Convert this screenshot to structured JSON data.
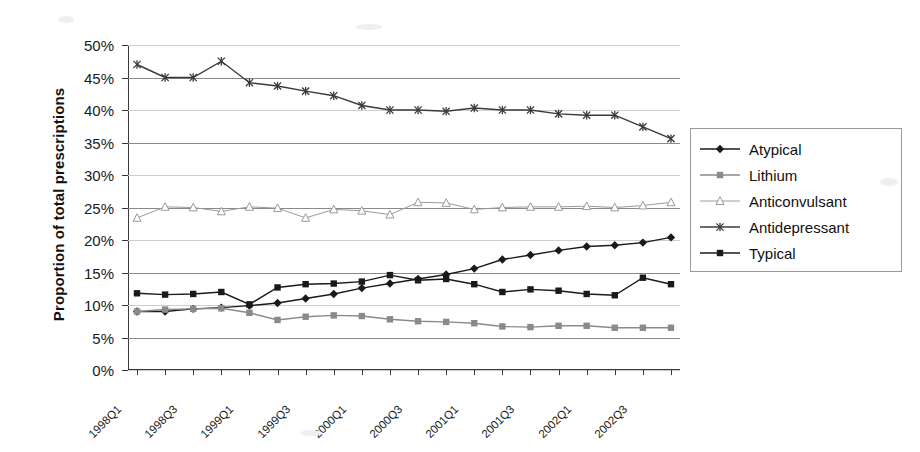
{
  "chart_data": {
    "type": "line",
    "title": "",
    "xlabel": "",
    "ylabel": "Proportion of total prescriptions",
    "ylim": [
      0,
      50
    ],
    "ytick_labels": [
      "0%",
      "5%",
      "10%",
      "15%",
      "20%",
      "25%",
      "30%",
      "35%",
      "40%",
      "45%",
      "50%"
    ],
    "ytick_values": [
      0,
      5,
      10,
      15,
      20,
      25,
      30,
      35,
      40,
      45,
      50
    ],
    "grid": true,
    "legend_position": "right",
    "x": [
      "1998Q1",
      "1998Q2",
      "1998Q3",
      "1998Q4",
      "1999Q1",
      "1999Q2",
      "1999Q3",
      "1999Q4",
      "2000Q1",
      "2000Q2",
      "2000Q3",
      "2000Q4",
      "2001Q1",
      "2001Q2",
      "2001Q3",
      "2001Q4",
      "2002Q1",
      "2002Q2",
      "2002Q3",
      "2002Q4"
    ],
    "xtick_labels": [
      "1998Q1",
      "1998Q3",
      "1999Q1",
      "1999Q3",
      "2000Q1",
      "2000Q3",
      "2001Q1",
      "2001Q3",
      "2002Q1",
      "2002Q3"
    ],
    "xtick_label_indices": [
      0,
      2,
      4,
      6,
      8,
      10,
      12,
      14,
      16,
      18
    ],
    "series": [
      {
        "name": "Atypical",
        "marker": "diamond",
        "color": "#1a1a1a",
        "values": [
          9.0,
          9.0,
          9.4,
          9.6,
          9.9,
          10.3,
          11.0,
          11.7,
          12.6,
          13.3,
          14.0,
          14.7,
          15.6,
          17.0,
          17.7,
          18.4,
          19.0,
          19.2,
          19.6,
          20.4
        ]
      },
      {
        "name": "Lithium",
        "marker": "square-gray",
        "color": "#8a8a8a",
        "values": [
          9.0,
          9.3,
          9.4,
          9.5,
          8.8,
          7.7,
          8.2,
          8.4,
          8.3,
          7.8,
          7.5,
          7.4,
          7.2,
          6.7,
          6.6,
          6.8,
          6.8,
          6.5,
          6.5,
          6.5
        ]
      },
      {
        "name": "Anticonvulsant",
        "marker": "triangle-open",
        "color": "#9a9a9a",
        "values": [
          23.4,
          25.1,
          25.0,
          24.4,
          25.1,
          24.9,
          23.4,
          24.7,
          24.5,
          23.9,
          25.8,
          25.7,
          24.7,
          25.0,
          25.1,
          25.1,
          25.2,
          25.0,
          25.3,
          25.8
        ]
      },
      {
        "name": "Antidepressant",
        "marker": "star",
        "color": "#3a3a3a",
        "values": [
          47.0,
          45.0,
          45.0,
          47.5,
          44.2,
          43.7,
          42.9,
          42.2,
          40.7,
          40.0,
          40.0,
          39.8,
          40.3,
          40.0,
          40.0,
          39.4,
          39.2,
          39.2,
          37.4,
          35.6
        ]
      },
      {
        "name": "Typical",
        "marker": "square-dark",
        "color": "#1a1a1a",
        "values": [
          11.8,
          11.6,
          11.7,
          12.0,
          10.1,
          12.7,
          13.2,
          13.3,
          13.6,
          14.6,
          13.8,
          14.0,
          13.2,
          12.0,
          12.4,
          12.2,
          11.7,
          11.5,
          14.2,
          13.2
        ]
      }
    ]
  },
  "legend": {
    "items": [
      {
        "label": "Atypical"
      },
      {
        "label": "Lithium"
      },
      {
        "label": "Anticonvulsant"
      },
      {
        "label": "Antidepressant"
      },
      {
        "label": "Typical"
      }
    ]
  }
}
